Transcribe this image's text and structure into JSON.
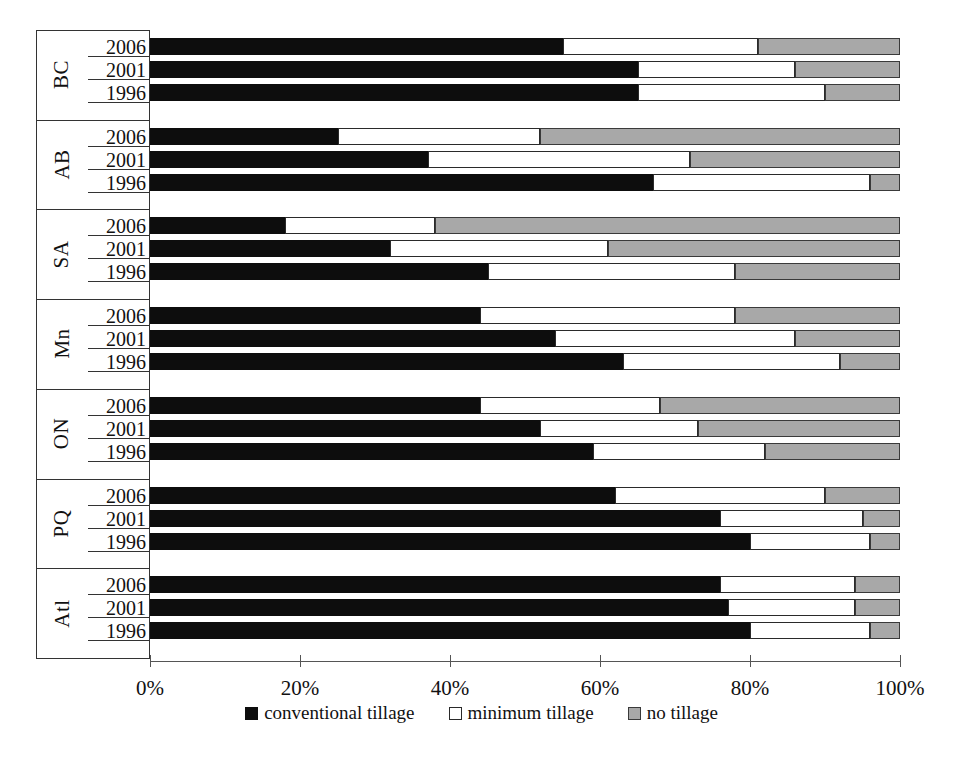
{
  "chart_data": {
    "type": "bar",
    "orientation": "horizontal",
    "stacked": true,
    "stack_total": 100,
    "title": "",
    "xlabel": "",
    "ylabel": "",
    "xlim": [
      0,
      100
    ],
    "grid": false,
    "legend_position": "bottom",
    "x_tick_labels": [
      "0%",
      "20%",
      "40%",
      "60%",
      "80%",
      "100%"
    ],
    "x_ticks": [
      0,
      20,
      40,
      60,
      80,
      100
    ],
    "series": [
      {
        "name": "conventional tillage",
        "color": "#0d0d0d",
        "values": [
          55,
          65,
          65,
          25,
          37,
          67,
          18,
          32,
          45,
          44,
          54,
          63,
          44,
          52,
          59,
          62,
          76,
          80,
          76,
          77,
          80
        ]
      },
      {
        "name": "minimum tillage",
        "color": "#ffffff",
        "values": [
          26,
          21,
          25,
          27,
          35,
          29,
          20,
          29,
          33,
          34,
          32,
          29,
          24,
          21,
          23,
          28,
          19,
          16,
          18,
          17,
          16
        ]
      },
      {
        "name": "no tillage",
        "color": "#a8a8a8",
        "values": [
          19,
          14,
          10,
          48,
          28,
          4,
          62,
          39,
          22,
          22,
          14,
          8,
          32,
          27,
          18,
          10,
          5,
          4,
          6,
          6,
          4
        ]
      }
    ],
    "groups": [
      {
        "label": "BC",
        "rows": [
          {
            "year": "2006",
            "conventional": 55,
            "minimum": 26,
            "no": 19
          },
          {
            "year": "2001",
            "conventional": 65,
            "minimum": 21,
            "no": 14
          },
          {
            "year": "1996",
            "conventional": 65,
            "minimum": 25,
            "no": 10
          }
        ]
      },
      {
        "label": "AB",
        "rows": [
          {
            "year": "2006",
            "conventional": 25,
            "minimum": 27,
            "no": 48
          },
          {
            "year": "2001",
            "conventional": 37,
            "minimum": 35,
            "no": 28
          },
          {
            "year": "1996",
            "conventional": 67,
            "minimum": 29,
            "no": 4
          }
        ]
      },
      {
        "label": "SA",
        "rows": [
          {
            "year": "2006",
            "conventional": 18,
            "minimum": 20,
            "no": 62
          },
          {
            "year": "2001",
            "conventional": 32,
            "minimum": 29,
            "no": 39
          },
          {
            "year": "1996",
            "conventional": 45,
            "minimum": 33,
            "no": 22
          }
        ]
      },
      {
        "label": "Mn",
        "rows": [
          {
            "year": "2006",
            "conventional": 44,
            "minimum": 34,
            "no": 22
          },
          {
            "year": "2001",
            "conventional": 54,
            "minimum": 32,
            "no": 14
          },
          {
            "year": "1996",
            "conventional": 63,
            "minimum": 29,
            "no": 8
          }
        ]
      },
      {
        "label": "ON",
        "rows": [
          {
            "year": "2006",
            "conventional": 44,
            "minimum": 24,
            "no": 32
          },
          {
            "year": "2001",
            "conventional": 52,
            "minimum": 21,
            "no": 27
          },
          {
            "year": "1996",
            "conventional": 59,
            "minimum": 23,
            "no": 18
          }
        ]
      },
      {
        "label": "PQ",
        "rows": [
          {
            "year": "2006",
            "conventional": 62,
            "minimum": 28,
            "no": 10
          },
          {
            "year": "2001",
            "conventional": 76,
            "minimum": 19,
            "no": 5
          },
          {
            "year": "1996",
            "conventional": 80,
            "minimum": 16,
            "no": 4
          }
        ]
      },
      {
        "label": "Atl",
        "rows": [
          {
            "year": "2006",
            "conventional": 76,
            "minimum": 18,
            "no": 6
          },
          {
            "year": "2001",
            "conventional": 77,
            "minimum": 17,
            "no": 6
          },
          {
            "year": "1996",
            "conventional": 80,
            "minimum": 16,
            "no": 4
          }
        ]
      }
    ],
    "legend": [
      {
        "label": "conventional tillage",
        "key": "conventional",
        "color": "#0d0d0d"
      },
      {
        "label": "minimum tillage",
        "key": "minimum",
        "color": "#ffffff"
      },
      {
        "label": "no tillage",
        "key": "no",
        "color": "#a8a8a8"
      }
    ]
  }
}
